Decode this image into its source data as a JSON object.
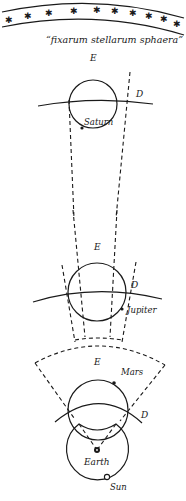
{
  "diagram": {
    "caption": "“fixarum stellarum sphaera”",
    "star_glyph": "✱",
    "labels": {
      "saturn": {
        "E": "E",
        "D": "D",
        "planet": "Saturn"
      },
      "jupiter": {
        "E": "E",
        "D": "D",
        "planet": "Jupiter"
      },
      "mars": {
        "E": "E",
        "D": "D",
        "planet": "Mars"
      },
      "earth": "Earth",
      "sun": "Sun"
    },
    "colors": {
      "ink": "#1a1a1a",
      "background": "#ffffff"
    }
  }
}
